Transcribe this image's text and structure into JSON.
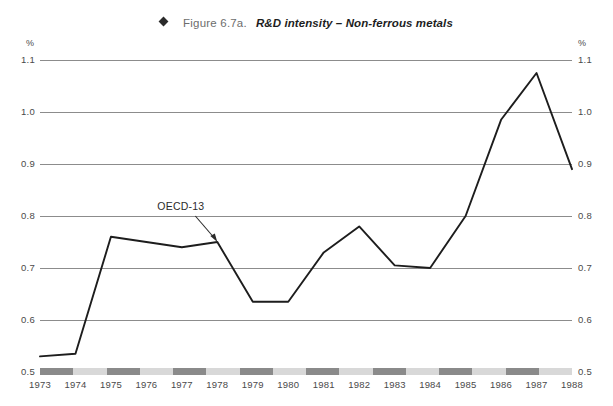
{
  "header": {
    "marker_icon": "diamond-marker",
    "figure_number": "Figure 6.7a.",
    "title": "R&D intensity – Non-ferrous metals"
  },
  "chart_data": {
    "type": "line",
    "title": "R&D intensity – Non-ferrous metals",
    "figure_number": "Figure 6.7a.",
    "xlabel": "",
    "ylabel": "%",
    "y_unit_left": "%",
    "y_unit_right": "%",
    "ylim": [
      0.5,
      1.1
    ],
    "yticks": [
      0.5,
      0.6,
      0.7,
      0.8,
      0.9,
      1.0,
      1.1
    ],
    "ytick_labels": [
      "0.5",
      "0.6",
      "0.7",
      "0.8",
      "0.9",
      "1.0",
      "1.1"
    ],
    "ytick_labels_right": [
      "0.5",
      "0.6",
      "0.7",
      "0.8",
      "0.9",
      "1.0",
      "1.1"
    ],
    "grid": true,
    "grid_axis": "y",
    "legend": "none",
    "dual_axis": true,
    "categories": [
      "1973",
      "1974",
      "1975",
      "1976",
      "1977",
      "1978",
      "1979",
      "1980",
      "1981",
      "1982",
      "1983",
      "1984",
      "1985",
      "1986",
      "1987",
      "1988"
    ],
    "series": [
      {
        "name": "OECD-13",
        "values": [
          0.53,
          0.535,
          0.76,
          0.75,
          0.74,
          0.75,
          0.635,
          0.635,
          0.73,
          0.78,
          0.705,
          0.7,
          0.8,
          0.985,
          1.075,
          0.89
        ],
        "color": "#1d1d1d"
      }
    ],
    "annotations": [
      {
        "text": "OECD-13",
        "points_to_year": "1978",
        "points_to_value": 0.75
      }
    ],
    "axis_band": {
      "pattern": "alternating",
      "dark_color": "#8a8a8a",
      "light_color": "#d8d8d8"
    }
  }
}
